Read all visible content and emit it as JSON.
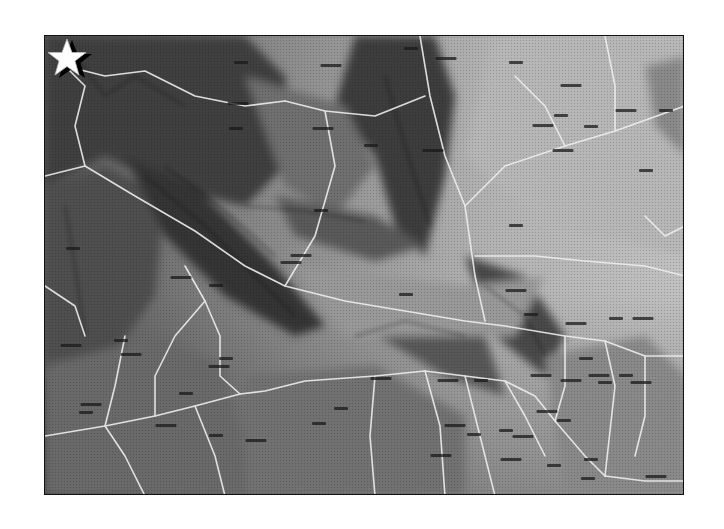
{
  "map": {
    "type": "shaded-relief-road-map",
    "rendering": "grayscale halftone",
    "frame": {
      "x": 44,
      "y": 35,
      "width": 640,
      "height": 460,
      "border_color": "#111111"
    },
    "colors": {
      "background": "#ffffff",
      "relief_dark": "#3a3a3a",
      "relief_mid": "#8c8c8c",
      "relief_light": "#c8c8c8",
      "roads": "#f2f2f2",
      "label_ink": "#1a1a1a",
      "star_fill": "#ffffff",
      "star_shadow": "#000000"
    },
    "marker": {
      "icon": "star-icon",
      "position_px": {
        "x": 131,
        "y": 290
      },
      "description": "white five-point star with black drop shadow marking a location in the western part of the map"
    },
    "labels_note": "Place-name labels are present throughout the map but are illegible at this resolution; rendered as dark label marks only.",
    "label_positions": [
      [
        240,
        62
      ],
      [
        330,
        65
      ],
      [
        410,
        48
      ],
      [
        445,
        58
      ],
      [
        515,
        62
      ],
      [
        570,
        85
      ],
      [
        665,
        110
      ],
      [
        237,
        103
      ],
      [
        235,
        128
      ],
      [
        322,
        128
      ],
      [
        370,
        145
      ],
      [
        432,
        150
      ],
      [
        560,
        115
      ],
      [
        625,
        110
      ],
      [
        320,
        210
      ],
      [
        300,
        255
      ],
      [
        515,
        225
      ],
      [
        542,
        125
      ],
      [
        590,
        126
      ],
      [
        562,
        150
      ],
      [
        645,
        170
      ],
      [
        290,
        262
      ],
      [
        405,
        294
      ],
      [
        515,
        290
      ],
      [
        530,
        314
      ],
      [
        575,
        323
      ],
      [
        615,
        318
      ],
      [
        642,
        318
      ],
      [
        72,
        248
      ],
      [
        180,
        277
      ],
      [
        215,
        285
      ],
      [
        70,
        345
      ],
      [
        120,
        340
      ],
      [
        130,
        354
      ],
      [
        225,
        358
      ],
      [
        218,
        366
      ],
      [
        585,
        358
      ],
      [
        570,
        380
      ],
      [
        625,
        375
      ],
      [
        640,
        382
      ],
      [
        185,
        393
      ],
      [
        165,
        425
      ],
      [
        85,
        412
      ],
      [
        90,
        404
      ],
      [
        215,
        435
      ],
      [
        255,
        440
      ],
      [
        318,
        423
      ],
      [
        380,
        378
      ],
      [
        340,
        408
      ],
      [
        447,
        380
      ],
      [
        480,
        380
      ],
      [
        540,
        375
      ],
      [
        604,
        382
      ],
      [
        546,
        411
      ],
      [
        563,
        420
      ],
      [
        454,
        425
      ],
      [
        473,
        434
      ],
      [
        440,
        455
      ],
      [
        505,
        430
      ],
      [
        522,
        436
      ],
      [
        590,
        459
      ],
      [
        598,
        375
      ],
      [
        613,
        497
      ],
      [
        655,
        476
      ],
      [
        587,
        478
      ],
      [
        510,
        459
      ],
      [
        553,
        465
      ]
    ]
  }
}
